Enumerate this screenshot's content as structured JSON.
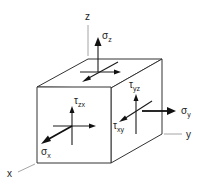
{
  "diagram": {
    "title": "",
    "type": "stress-element-cube",
    "axes": {
      "x": "x",
      "y": "y",
      "z": "z"
    },
    "labels": {
      "sigma_z": {
        "symbol": "σ",
        "sub": "z"
      },
      "sigma_x": {
        "symbol": "σ",
        "sub": "x"
      },
      "sigma_y": {
        "symbol": "σ",
        "sub": "y"
      },
      "tau_zx": {
        "symbol": "τ",
        "sub": "zx"
      },
      "tau_yz": {
        "symbol": "τ",
        "sub": "yz"
      },
      "tau_xy": {
        "symbol": "τ",
        "sub": "xy"
      }
    },
    "colors": {
      "background": "#ffffff",
      "edge": "#333333",
      "arrow": "#111111",
      "axis": "#9a9a9a"
    }
  }
}
